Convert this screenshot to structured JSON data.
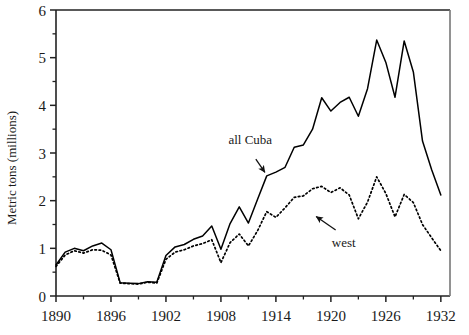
{
  "chart_data": {
    "type": "line",
    "title": "",
    "xlabel": "",
    "ylabel": "Metric tons (millions)",
    "xlim": [
      1890,
      1933
    ],
    "ylim": [
      0,
      6
    ],
    "grid": false,
    "legend_position": "inline-annotations",
    "x_ticks_major": [
      1890,
      1896,
      1902,
      1908,
      1914,
      1920,
      1926,
      1932
    ],
    "x_ticks_minor": [
      1893,
      1899,
      1905,
      1911,
      1917,
      1923,
      1929
    ],
    "y_ticks_major": [
      0,
      1,
      2,
      3,
      4,
      5,
      6
    ],
    "y_ticks_minor": [
      0.5,
      1.5,
      2.5,
      3.5,
      4.5,
      5.5
    ],
    "x_tick_labels": [
      "1890",
      "1896",
      "1902",
      "1908",
      "1914",
      "1920",
      "1926",
      "1932"
    ],
    "y_tick_labels": [
      "0",
      "1",
      "2",
      "3",
      "4",
      "5",
      "6"
    ],
    "annotations": [
      {
        "text": "all Cuba",
        "text_x": 1911.2,
        "text_y": 3.18,
        "point_x": 1913.0,
        "point_y": 2.52
      },
      {
        "text": "west",
        "text_x": 1921.4,
        "text_y": 1.03,
        "point_x": 1918.1,
        "point_y": 1.73
      }
    ],
    "x": [
      1890,
      1891,
      1892,
      1893,
      1894,
      1895,
      1896,
      1897,
      1898,
      1899,
      1900,
      1901,
      1902,
      1903,
      1904,
      1905,
      1906,
      1907,
      1908,
      1909,
      1910,
      1911,
      1912,
      1913,
      1914,
      1915,
      1916,
      1917,
      1918,
      1919,
      1920,
      1921,
      1922,
      1923,
      1924,
      1925,
      1926,
      1927,
      1928,
      1929,
      1930,
      1931,
      1932
    ],
    "series": [
      {
        "name": "all Cuba",
        "style": "solid",
        "color": "#000000",
        "values": [
          0.65,
          0.92,
          1.0,
          0.95,
          1.05,
          1.11,
          0.97,
          0.28,
          0.27,
          0.26,
          0.3,
          0.29,
          0.85,
          1.03,
          1.08,
          1.19,
          1.26,
          1.47,
          0.98,
          1.52,
          1.87,
          1.53,
          2.03,
          2.52,
          2.6,
          2.7,
          3.12,
          3.17,
          3.5,
          4.16,
          3.88,
          4.06,
          4.17,
          3.77,
          4.35,
          5.37,
          4.9,
          4.17,
          5.35,
          4.7,
          3.25,
          2.65,
          2.12
        ]
      },
      {
        "name": "west",
        "style": "dotted",
        "color": "#000000",
        "values": [
          0.62,
          0.86,
          0.95,
          0.9,
          0.97,
          0.96,
          0.86,
          0.27,
          0.26,
          0.25,
          0.29,
          0.27,
          0.77,
          0.92,
          0.97,
          1.05,
          1.1,
          1.18,
          0.7,
          1.12,
          1.3,
          1.05,
          1.37,
          1.77,
          1.65,
          1.85,
          2.07,
          2.1,
          2.25,
          2.3,
          2.17,
          2.27,
          2.12,
          1.62,
          1.97,
          2.5,
          2.15,
          1.66,
          2.13,
          1.96,
          1.5,
          1.22,
          0.95
        ]
      }
    ]
  }
}
